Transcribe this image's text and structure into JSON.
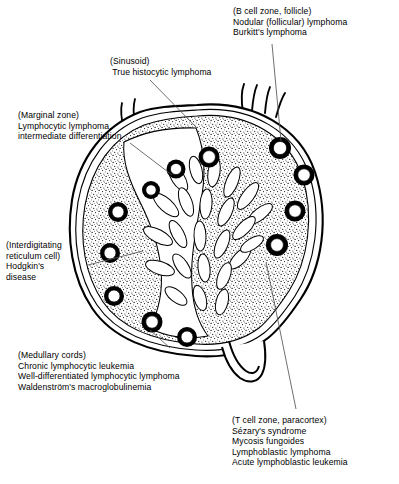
{
  "figure": {
    "colors": {
      "ink": "#000000",
      "background": "#ffffff",
      "stipple": "#000000",
      "leader_line": "#555555"
    }
  },
  "labels": {
    "b_cell_zone": {
      "region": "(B cell zone, follicle)",
      "lines": [
        "(B cell zone, follicle)",
        "Nodular (follicular) lymphoma",
        "Burkitt's lymphoma"
      ]
    },
    "sinusoid": {
      "region": "(Sinusoid)",
      "lines": [
        "(Sinusoid)",
        " True histocytic lymphoma"
      ]
    },
    "marginal_zone": {
      "region": "(Marginal zone)",
      "lines": [
        "(Marginal zone)",
        "Lymphocytic lymphoma,",
        "intermediate differentiation"
      ]
    },
    "interdigitating_reticulum_cell": {
      "region": "(Interdigitating reticulum cell)",
      "lines": [
        "(Interdigitating",
        "reticulum cell)",
        "Hodgkin's",
        "disease"
      ]
    },
    "medullary_cords": {
      "region": "(Medullary cords)",
      "lines": [
        "(Medullary cords)",
        "Chronic lymphocytic leukemia",
        "Well-differentiated lymphocytic lymphoma",
        "Waldenström's macroglobulinemia"
      ]
    },
    "t_cell_zone": {
      "region": "(T cell zone, paracortex)",
      "lines": [
        "(T cell zone, paracortex)",
        "Sézary's syndrome",
        "Mycosis fungoides",
        "Lymphoblastic lymphoma",
        "Acute lymphoblastic leukemia"
      ]
    }
  },
  "anatomy": {
    "capsule": "outer double-line capsule",
    "subcapsular_sinus": "narrow clear band beneath capsule",
    "cortex": "stippled peripheral zone",
    "follicles_count": 11,
    "medullary_cords": "finger-like pale cords radiating toward hilum",
    "afferent_vessels": 4,
    "efferent_vessel": "hilum notch at lower right"
  }
}
